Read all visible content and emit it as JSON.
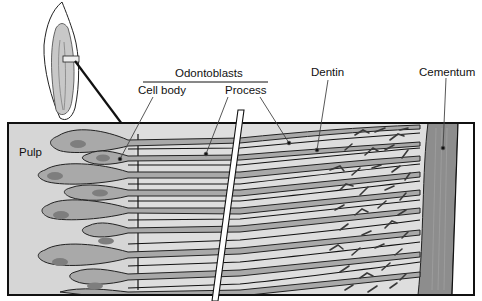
{
  "labels": {
    "odontoblasts": "Odontoblasts",
    "cell_body": "Cell body",
    "process": "Process",
    "dentin": "Dentin",
    "cementum": "Cementum",
    "pulp": "Pulp"
  },
  "colors": {
    "pulp_bg": "#d9d9d9",
    "cell": "#a9a9a9",
    "nucleus": "#7f7f7f",
    "dentin_bg": "#dcdcdc",
    "cementum": "#8c8c8c",
    "outline": "#1a1a1a"
  }
}
